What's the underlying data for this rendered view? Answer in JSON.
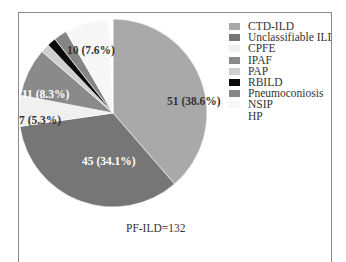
{
  "chart_data": {
    "type": "pie",
    "title": "",
    "total_label": "PF-ILD=132",
    "total": 132,
    "start_angle_deg": 0,
    "direction": "clockwise",
    "slices": [
      {
        "name": "CTD-ILD",
        "value": 51,
        "percent": 38.6,
        "label": "51 (38.6%)",
        "color": "#a9a9a9",
        "label_color": "#333333"
      },
      {
        "name": "Unclassifiable ILD",
        "value": 45,
        "percent": 34.1,
        "label": "45 (34.1%)",
        "color": "#767676",
        "label_color": "#ffffff"
      },
      {
        "name": "CPFE",
        "value": 7,
        "percent": 5.3,
        "label": "7 (5.3%)",
        "color": "#f0f0f0",
        "label_color": "#333333"
      },
      {
        "name": "IPAF",
        "value": 11,
        "percent": 8.3,
        "label": "11 (8.3%)",
        "color": "#8a8a8a",
        "label_color": "#ffffff"
      },
      {
        "name": "PAP",
        "value": 2,
        "percent": 1.5,
        "label": "",
        "color": "#cfcfcf",
        "label_color": "#333333"
      },
      {
        "name": "RBILD",
        "value": 2,
        "percent": 1.5,
        "label": "",
        "color": "#0a0a0a",
        "label_color": "#333333"
      },
      {
        "name": "Pneumoconiosis",
        "value": 3,
        "percent": 2.3,
        "label": "",
        "color": "#858585",
        "label_color": "#333333"
      },
      {
        "name": "NSIP",
        "value": 10,
        "percent": 7.6,
        "label": "10 (7.6%)",
        "color": "#f7f7f7",
        "label_color": "#333333"
      },
      {
        "name": "HP",
        "value": 1,
        "percent": 0.8,
        "label": "",
        "color": "#ffffff",
        "label_color": "#333333"
      }
    ],
    "legend": [
      "CTD-ILD",
      "Unclassifiable ILD",
      "CPFE",
      "IPAF",
      "PAP",
      "RBILD",
      "Pneumoconiosis",
      "NSIP",
      "HP"
    ],
    "legend_position": "right"
  },
  "legend": {
    "items": [
      {
        "label": "CTD-ILD",
        "color": "#a9a9a9"
      },
      {
        "label": "Unclassifiable ILD",
        "color": "#767676"
      },
      {
        "label": "CPFE",
        "color": "#f0f0f0"
      },
      {
        "label": "IPAF",
        "color": "#8a8a8a"
      },
      {
        "label": "PAP",
        "color": "#cfcfcf"
      },
      {
        "label": "RBILD",
        "color": "#0a0a0a"
      },
      {
        "label": "Pneumoconiosis",
        "color": "#858585"
      },
      {
        "label": "NSIP",
        "color": "#f7f7f7"
      },
      {
        "label": "HP",
        "color": "#ffffff"
      }
    ]
  },
  "footer": {
    "total_label": "PF-ILD=132"
  }
}
